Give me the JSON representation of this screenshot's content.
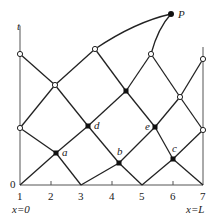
{
  "diagram": {
    "colors": {
      "line": "#222222",
      "axis": "#555555",
      "node_fill": "#111111",
      "open_fill": "#ffffff"
    },
    "axes": {
      "t_label": "t",
      "origin_label": "0",
      "left_boundary_label": "x=0",
      "right_boundary_label": "x=L",
      "ticks": [
        "1",
        "2",
        "3",
        "4",
        "5",
        "6",
        "7"
      ]
    },
    "points": {
      "P": "P",
      "a": "a",
      "b": "b",
      "c": "c",
      "d": "d",
      "e": "e"
    }
  }
}
